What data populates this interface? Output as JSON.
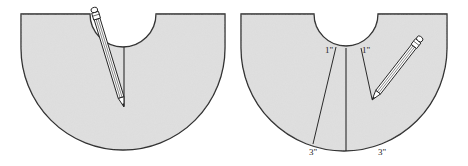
{
  "figure": {
    "panels": [
      {
        "id": "left",
        "description": "circular skirt pattern with center slit and pencil marking"
      },
      {
        "id": "right",
        "description": "circular skirt pattern with two wedge lines marked and pencil"
      }
    ],
    "labels": {
      "left_top": "1\"",
      "right_top": "1\"",
      "left_bottom": "3\"",
      "right_bottom": "3\""
    },
    "colors": {
      "fabric": "#dcdcdc",
      "outline": "#2a2a2a",
      "background": "#ffffff"
    }
  }
}
